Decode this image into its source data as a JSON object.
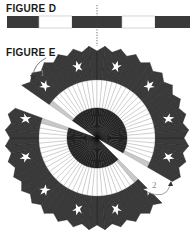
{
  "figures": {
    "d": {
      "label": "FIGURE D"
    },
    "e": {
      "label": "FIGURE E"
    }
  },
  "strip": {
    "segments": [
      {
        "x": 7,
        "w": 32,
        "color": "#3a3a3a"
      },
      {
        "x": 39,
        "w": 33,
        "color": "#ffffff"
      },
      {
        "x": 72,
        "w": 50,
        "color": "#3a3a3a"
      },
      {
        "x": 122,
        "w": 33,
        "color": "#ffffff"
      },
      {
        "x": 155,
        "w": 35,
        "color": "#3a3a3a"
      }
    ]
  },
  "fan": {
    "center": [
      97,
      138
    ],
    "outer_radius": 92,
    "white_outer_radius": 58,
    "inner_radius": 30,
    "star_count": 12,
    "colors": {
      "dark": "#3a3a3a",
      "white": "#ffffff",
      "fold": "#c8c8c8",
      "star": "#ffffff"
    }
  },
  "steps": [
    {
      "label": "1"
    },
    {
      "label": "2"
    }
  ]
}
